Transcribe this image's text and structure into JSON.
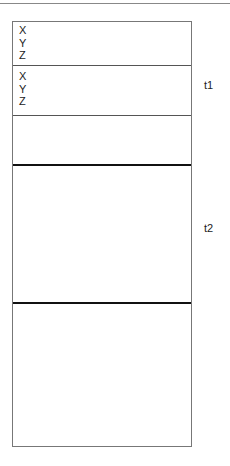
{
  "diagram": {
    "sections": [
      {
        "attributes": [
          "X",
          "Y",
          "Z"
        ]
      },
      {
        "attributes": [
          "X",
          "Y",
          "Z"
        ]
      }
    ],
    "labels": {
      "t1": "t1",
      "t2": "t2"
    }
  }
}
